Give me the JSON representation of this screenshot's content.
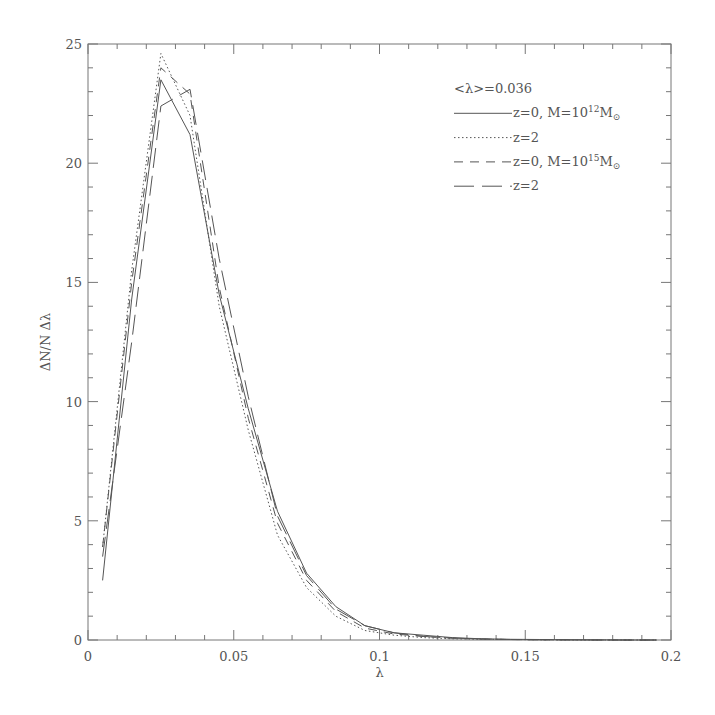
{
  "chart_data": {
    "type": "line",
    "title": "",
    "xlabel": "λ",
    "ylabel": "ΔN/N Δλ",
    "xlim": [
      0,
      0.2
    ],
    "ylim": [
      0,
      25
    ],
    "grid": false,
    "legend_position": "upper right",
    "annotation": "<λ>=0.036",
    "xticks": [
      0,
      0.05,
      0.1,
      0.15,
      0.2
    ],
    "xtick_labels": [
      "0",
      "0.05",
      "0.1",
      "0.15",
      "0.2"
    ],
    "yticks": [
      0,
      5,
      10,
      15,
      20,
      25
    ],
    "ytick_labels": [
      "0",
      "5",
      "10",
      "15",
      "20",
      "25"
    ],
    "x": [
      0.005,
      0.015,
      0.025,
      0.035,
      0.045,
      0.055,
      0.065,
      0.075,
      0.085,
      0.095,
      0.105,
      0.115,
      0.125,
      0.135,
      0.145,
      0.155,
      0.165,
      0.175,
      0.185,
      0.195
    ],
    "series": [
      {
        "name": "z=0, M=10^12 M_sun",
        "label_main": "z=0,  M=10",
        "label_sup": "12",
        "label_tail": "M",
        "label_sub": "⊙",
        "style": "solid",
        "values": [
          2.5,
          14.3,
          23.5,
          21.2,
          14.5,
          9.7,
          5.4,
          2.8,
          1.4,
          0.6,
          0.3,
          0.2,
          0.1,
          0.05,
          0.03,
          0.02,
          0.01,
          0.01,
          0.0,
          0.0
        ]
      },
      {
        "name": "z=2 (M=10^12 M_sun)",
        "label_main": "z=2",
        "label_sup": "",
        "label_tail": "",
        "label_sub": "",
        "style": "dotted",
        "values": [
          3.9,
          15.5,
          24.6,
          22.0,
          14.0,
          8.8,
          4.4,
          2.2,
          1.0,
          0.4,
          0.2,
          0.1,
          0.05,
          0.03,
          0.02,
          0.01,
          0.0,
          0.0,
          0.0,
          0.0
        ]
      },
      {
        "name": "z=0, M=10^15 M_sun",
        "label_main": "z=0,  M=10",
        "label_sup": "15",
        "label_tail": "M",
        "label_sub": "⊙",
        "style": "dashed",
        "values": [
          3.9,
          15.0,
          24.0,
          22.9,
          14.8,
          9.3,
          4.9,
          2.5,
          1.2,
          0.5,
          0.25,
          0.15,
          0.08,
          0.04,
          0.02,
          0.01,
          0.01,
          0.0,
          0.0,
          0.0
        ]
      },
      {
        "name": "z=2 (M=10^15 M_sun)",
        "label_main": "z=2",
        "label_sup": "",
        "label_tail": "",
        "label_sub": "",
        "style": "longdash",
        "values": [
          3.5,
          12.5,
          22.4,
          23.1,
          16.0,
          10.2,
          5.2,
          2.7,
          1.3,
          0.6,
          0.3,
          0.15,
          0.08,
          0.04,
          0.02,
          0.01,
          0.01,
          0.0,
          0.0,
          0.0
        ]
      }
    ]
  },
  "layout": {
    "plot_left": 88,
    "plot_right": 671,
    "plot_top": 44,
    "plot_bottom": 640,
    "legend_x": 454,
    "legend_line_end": 512,
    "legend_top": 88,
    "legend_row": 24.3
  },
  "colors": {
    "line": "#555555",
    "axis": "#777777",
    "text": "#555555"
  }
}
